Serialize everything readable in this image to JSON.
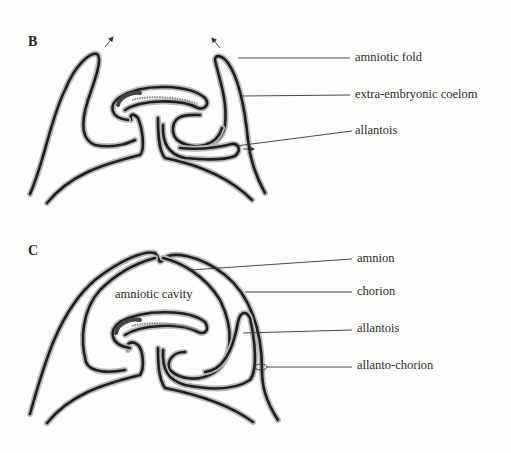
{
  "figure": {
    "panels": [
      {
        "id": "B",
        "letter": "B",
        "labels": [
          {
            "text": "amniotic fold"
          },
          {
            "text": "extra-embryonic coelom"
          },
          {
            "text": "allantois"
          }
        ]
      },
      {
        "id": "C",
        "letter": "C",
        "inner_label": "amniotic cavity",
        "labels": [
          {
            "text": "amnion"
          },
          {
            "text": "chorion"
          },
          {
            "text": "allantois"
          },
          {
            "text": "allanto-chorion"
          }
        ]
      }
    ],
    "colors": {
      "membrane": "#1e1e1e",
      "membrane_halo": "#b9b9b9",
      "background": "#fdfdfb"
    }
  }
}
